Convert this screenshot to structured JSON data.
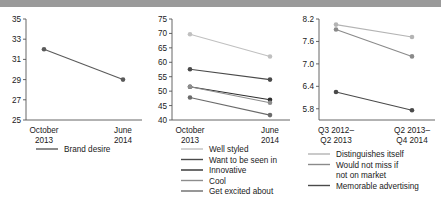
{
  "page": {
    "background": "#ffffff",
    "top_band_color": "#9a9a9a"
  },
  "chart_data": [
    {
      "id": "left",
      "type": "line",
      "title": "",
      "xlabel": "",
      "ylabel": "",
      "categories": [
        "October 2013",
        "June 2014"
      ],
      "category_lines": [
        [
          "October",
          "2013"
        ],
        [
          "June",
          "2014"
        ]
      ],
      "yticks": [
        25,
        27,
        29,
        31,
        33,
        35
      ],
      "ylim": [
        25,
        35
      ],
      "grid": false,
      "legend_position": "below",
      "series": [
        {
          "name": "Brand desire",
          "values": [
            32.0,
            29.0
          ],
          "color": "#5a5a5a"
        }
      ]
    },
    {
      "id": "middle",
      "type": "line",
      "title": "",
      "xlabel": "",
      "ylabel": "",
      "categories": [
        "October 2013",
        "June 2014"
      ],
      "category_lines": [
        [
          "October",
          "2013"
        ],
        [
          "June",
          "2014"
        ]
      ],
      "yticks": [
        40,
        45,
        50,
        55,
        60,
        65,
        70,
        75
      ],
      "ylim": [
        40,
        75
      ],
      "grid": false,
      "legend_position": "below",
      "series": [
        {
          "name": "Well styled",
          "values": [
            69.7,
            62.0
          ],
          "color": "#c0c0c0"
        },
        {
          "name": "Want to be seen in",
          "values": [
            57.6,
            54.0
          ],
          "color": "#4a4a4a"
        },
        {
          "name": "Innovative",
          "values": [
            51.5,
            47.0
          ],
          "color": "#2e2e2e"
        },
        {
          "name": "Cool",
          "values": [
            51.5,
            46.0
          ],
          "color": "#8d8d8d"
        },
        {
          "name": "Get excited about",
          "values": [
            47.8,
            41.7
          ],
          "color": "#6b6b6b"
        }
      ]
    },
    {
      "id": "right",
      "type": "line",
      "title": "",
      "xlabel": "",
      "ylabel": "",
      "categories": [
        "Q3 2012– Q2 2013",
        "Q2 2013– Q4 2014"
      ],
      "category_lines": [
        [
          "Q3 2012–",
          "Q2 2013"
        ],
        [
          "Q2 2013–",
          "Q4 2014"
        ]
      ],
      "yticks": [
        5.8,
        6.4,
        7.0,
        7.6,
        8.2
      ],
      "ylim": [
        5.5,
        8.2
      ],
      "grid": false,
      "legend_position": "below",
      "series": [
        {
          "name": "Distinguishes itself",
          "values": [
            8.05,
            7.72
          ],
          "color": "#b4b4b4"
        },
        {
          "name": "Would not miss if not on market",
          "values": [
            7.92,
            7.2
          ],
          "color": "#8a8a8a"
        },
        {
          "name": "Memorable advertising",
          "values": [
            6.25,
            5.76
          ],
          "color": "#4a4a4a"
        }
      ]
    }
  ],
  "legends": {
    "left": [
      {
        "label": "Brand desire",
        "color": "#5a5a5a"
      }
    ],
    "middle": [
      {
        "label": "Well styled",
        "color": "#c0c0c0"
      },
      {
        "label": "Want to be seen in",
        "color": "#4a4a4a"
      },
      {
        "label": "Innovative",
        "color": "#2e2e2e"
      },
      {
        "label": "Cool",
        "color": "#8d8d8d"
      },
      {
        "label": "Get excited about",
        "color": "#6b6b6b"
      }
    ],
    "right": [
      {
        "label": "Distinguishes itself",
        "color": "#b4b4b4"
      },
      {
        "label": "Would not miss if",
        "label2": "not on market",
        "color": "#8a8a8a"
      },
      {
        "label": "Memorable advertising",
        "color": "#4a4a4a"
      }
    ]
  }
}
